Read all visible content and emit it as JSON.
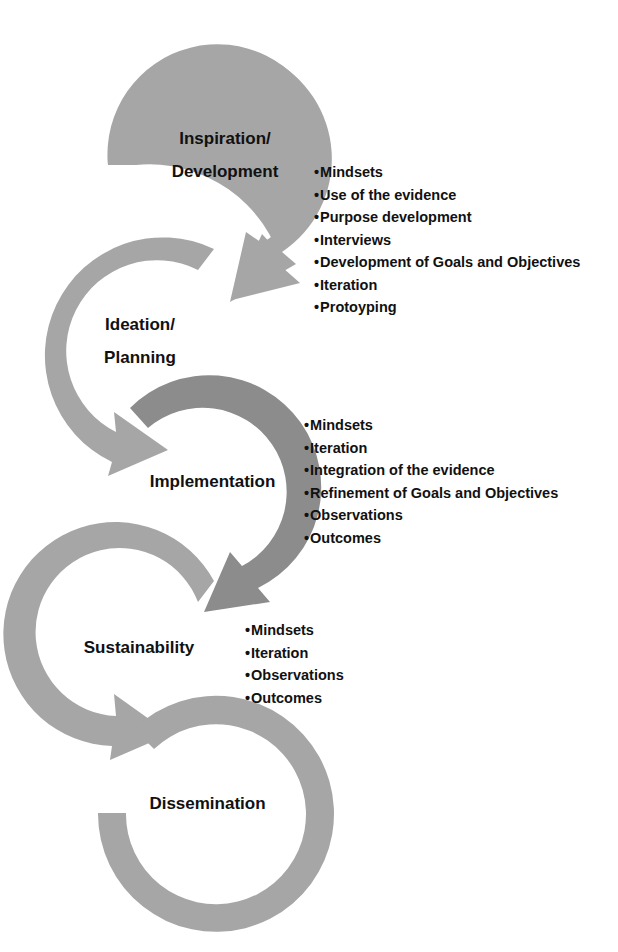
{
  "colors": {
    "arc_light": "#a6a6a6",
    "arc_dark": "#8c8c8c",
    "text": "#111111",
    "background": "#ffffff"
  },
  "stages": [
    {
      "id": "inspiration",
      "label_line1": "Inspiration/",
      "label_line2": "Development",
      "bullets": [
        "Mindsets",
        "Use of the evidence",
        "Purpose development",
        "Interviews",
        "Development of Goals and Objectives",
        "Iteration",
        "Protoyping"
      ]
    },
    {
      "id": "ideation",
      "label_line1": "Ideation/",
      "label_line2": "Planning",
      "bullets": []
    },
    {
      "id": "implementation",
      "label_line1": "Implementation",
      "bullets": [
        "Mindsets",
        "Iteration",
        "Integration of the evidence",
        "Refinement of Goals and Objectives",
        "Observations",
        "Outcomes"
      ]
    },
    {
      "id": "sustainability",
      "label_line1": "Sustainability",
      "bullets": [
        "Mindsets",
        "Iteration",
        "Observations",
        "Outcomes"
      ]
    },
    {
      "id": "dissemination",
      "label_line1": "Dissemination",
      "bullets": []
    }
  ]
}
